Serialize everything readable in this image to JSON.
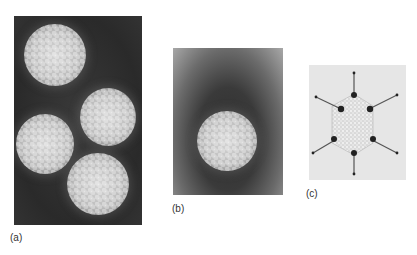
{
  "figure": {
    "panels": [
      {
        "id": "a",
        "label": "(a)",
        "description": "Electron micrograph of four icosahedral virus particles on dark background"
      },
      {
        "id": "b",
        "label": "(b)",
        "description": "Electron micrograph of a single icosahedral virus particle with dark halo"
      },
      {
        "id": "c",
        "label": "(c)",
        "description": "Model of icosahedral capsid with protruding fibers at vertices"
      }
    ]
  }
}
